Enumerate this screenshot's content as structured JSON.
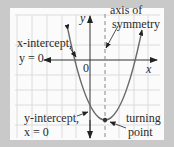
{
  "diagram": {
    "axes": {
      "x_label": "x",
      "y_label": "y",
      "origin_label": "0"
    },
    "labels": {
      "x_intercept": {
        "line1": "x-intercept,",
        "line2": "y = 0"
      },
      "y_intercept": {
        "line1": "y-intercept,",
        "line2": "x = 0"
      },
      "axis_of_symmetry": {
        "line1": "axis of",
        "line2": "symmetry"
      },
      "turning_point": {
        "line1": "turning",
        "line2": "point"
      }
    },
    "colors": {
      "background": "#c9c9c9",
      "panel": "#fbfbfb",
      "grid": "#dcdcdc",
      "curve": "#6a6a6a",
      "axis": "#333333",
      "text": "#2b2b2b"
    }
  }
}
